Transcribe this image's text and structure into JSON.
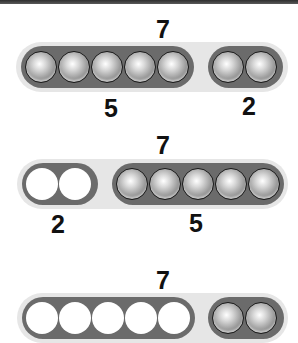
{
  "rows": [
    {
      "total": "7",
      "left": {
        "label": "5",
        "count": 5,
        "state": "filled"
      },
      "right": {
        "label": "2",
        "count": 2,
        "state": "filled"
      }
    },
    {
      "total": "7",
      "left": {
        "label": "2",
        "count": 2,
        "state": "empty"
      },
      "right": {
        "label": "5",
        "count": 5,
        "state": "filled"
      }
    },
    {
      "total": "7",
      "left": {
        "label": "",
        "count": 5,
        "state": "empty"
      },
      "right": {
        "label": "",
        "count": 2,
        "state": "filled"
      }
    }
  ],
  "colors": {
    "outer_track": "#e6e6e6",
    "inner_pill": "#6b6b6b",
    "ball": "#a0a0a0",
    "empty_slot": "#ffffff",
    "top_bar": "#3a3a3a"
  }
}
